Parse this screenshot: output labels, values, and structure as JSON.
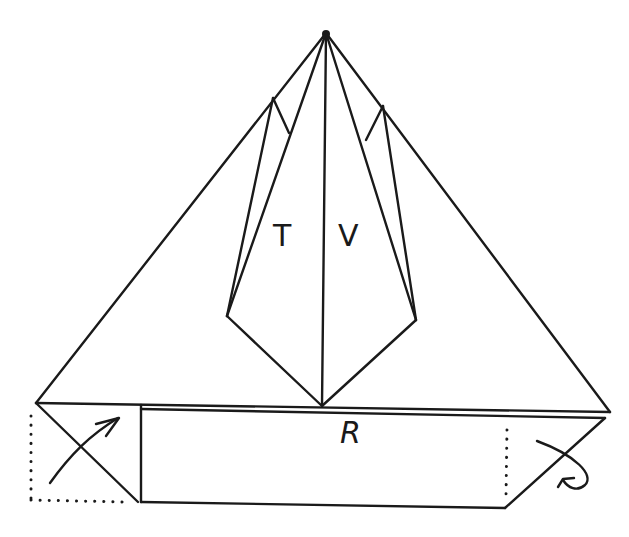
{
  "diagram": {
    "type": "origami-fold-diagram",
    "labels": {
      "T": "T",
      "V": "V",
      "R": "R"
    },
    "colors": {
      "line": "#1a1a1a",
      "background": "#ffffff"
    },
    "arrows": [
      {
        "name": "fold-up-arrow",
        "position": "bottom-left",
        "meaning": "fold corner up"
      },
      {
        "name": "fold-behind-arrow",
        "position": "bottom-right",
        "meaning": "fold corner behind"
      }
    ],
    "dotted_lines": [
      {
        "name": "left-dotted-corner",
        "meaning": "hidden/ghost outline of folded corner"
      },
      {
        "name": "right-dotted-line",
        "meaning": "fold line"
      }
    ]
  }
}
